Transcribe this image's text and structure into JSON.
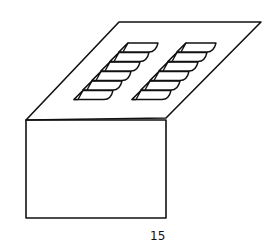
{
  "figure": {
    "label": "15",
    "stroke_color": "#111111",
    "background": "#ffffff",
    "louver_columns": 2,
    "louvers_per_column": 6
  }
}
